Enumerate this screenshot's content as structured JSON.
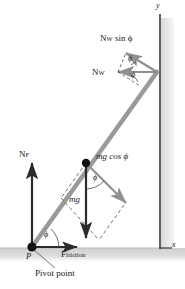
{
  "figure": {
    "colors": {
      "ladder": "#9a9a9a",
      "vector_gray": "#8f8f8f",
      "vector_dark": "#2b2b2b",
      "wall": "#3a3a3a",
      "wall_shade": "#e4e4e4",
      "ground_shade": "#d8d8d8",
      "dashed": "#4a4a4a",
      "text": "#1a1a1a"
    },
    "axes": {
      "y_label": "y",
      "x_label": "x"
    },
    "labels": {
      "normal_wall_sin": "N",
      "normal_wall_sin_sub": "W",
      "normal_wall_sin_rest": " sin ϕ",
      "normal_wall": "N",
      "normal_wall_sub": "W",
      "normal_floor": "N",
      "normal_floor_sub": "F",
      "weight_cos": "mg cos ϕ",
      "weight": "mg",
      "friction": "F",
      "friction_sub": "friction",
      "pivot_marker": "P",
      "pivot_caption": "Pivot point",
      "angle_symbol": "ϕ"
    },
    "angles": [
      {
        "name": "angle-at-pivot",
        "symbol": "ϕ"
      },
      {
        "name": "angle-at-midpoint",
        "symbol": "ϕ"
      },
      {
        "name": "angle-wall-upper",
        "symbol": "ϕ"
      },
      {
        "name": "angle-wall-lower",
        "symbol": "ϕ"
      }
    ],
    "geometry": {
      "pivot_x": 32,
      "pivot_y": 247,
      "top_x": 157,
      "top_y": 72,
      "mid_x": 86,
      "mid_y": 163,
      "wall_x": 160,
      "ground_y": 248
    }
  }
}
